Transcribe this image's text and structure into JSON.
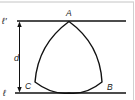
{
  "diagram": {
    "labels": {
      "top_line": "ℓ′",
      "bottom_line": "ℓ",
      "distance": "d",
      "vertex_a": "A",
      "vertex_b": "B",
      "vertex_c": "C"
    },
    "colors": {
      "stroke": "#111111",
      "frame": "#bdbdbd",
      "background": "#ffffff"
    }
  }
}
